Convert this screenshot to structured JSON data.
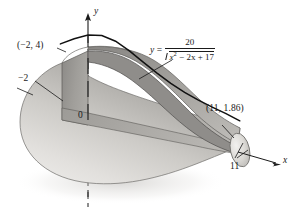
{
  "figure": {
    "kind": "solid-of-revolution",
    "background_color": "#ffffff"
  },
  "equation": {
    "lhs": "y",
    "equals": "=",
    "numerator": "20",
    "denominator_prefix": "x",
    "denominator_exponent": "2",
    "denominator_rest": "− 2x + 17",
    "denominator_plain": "x2 − 2x + 17",
    "full_text": "y = 20 / √(x² − 2x + 17)"
  },
  "labels": {
    "point_left": "(−2, 4)",
    "tick_left": "−2",
    "origin": "0",
    "point_right": "(11, 1.86)",
    "tick_right": "11",
    "axis_x": "x",
    "axis_y": "y"
  },
  "chart_data": {
    "type": "line",
    "title": "",
    "xlabel": "x",
    "ylabel": "y",
    "function": "y = 20/sqrt(x^2 - 2x + 17)",
    "xlim": [
      -2,
      11
    ],
    "ylim": [
      0,
      5
    ],
    "grid": false,
    "legend": "none",
    "annotations": [
      {
        "text": "(−2, 4)",
        "x": -2,
        "y": 4
      },
      {
        "text": "(11, 1.86)",
        "x": 11,
        "y": 1.86
      },
      {
        "text": "−2",
        "x": -2,
        "y": 0
      },
      {
        "text": "11",
        "x": 11,
        "y": 0
      }
    ],
    "x": [
      -2,
      -1,
      0,
      1,
      2,
      3,
      4,
      5,
      6,
      7,
      8,
      9,
      10,
      11
    ],
    "values": [
      4.0,
      4.47,
      4.85,
      5.0,
      4.85,
      4.47,
      4.0,
      3.54,
      3.14,
      2.8,
      2.52,
      2.29,
      2.1,
      1.86
    ],
    "colors": {
      "curve": "#111111",
      "surface_light": "#d8d6d2",
      "surface_mid": "#b4b2ae",
      "surface_dark": "#8d8b88",
      "cut_plane": "#9e9c99",
      "axis": "#1a1a1a"
    }
  }
}
